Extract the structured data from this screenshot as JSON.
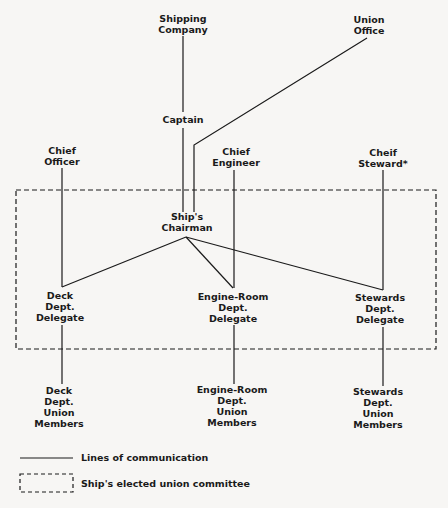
{
  "nodes": {
    "shipping_company": {
      "lines": [
        "Shipping",
        "Company"
      ]
    },
    "union_office": {
      "lines": [
        "Union",
        "Office"
      ]
    },
    "captain": {
      "lines": [
        "Captain"
      ]
    },
    "chief_officer": {
      "lines": [
        "Chief",
        "Officer"
      ]
    },
    "chief_engineer": {
      "lines": [
        "Chief",
        "Engineer"
      ]
    },
    "chief_steward": {
      "lines": [
        "Cheif",
        "Steward*"
      ]
    },
    "ships_chairman": {
      "lines": [
        "Ship's",
        "Chairman"
      ]
    },
    "deck_delegate": {
      "lines": [
        "Deck",
        "Dept.",
        "Delegate"
      ]
    },
    "engine_delegate": {
      "lines": [
        "Engine-Room",
        "Dept.",
        "Delegate"
      ]
    },
    "stewards_delegate": {
      "lines": [
        "Stewards",
        "Dept.",
        "Delegate"
      ]
    },
    "deck_members": {
      "lines": [
        "Deck",
        "Dept.",
        "Union",
        "Members"
      ]
    },
    "engine_members": {
      "lines": [
        "Engine-Room",
        "Dept.",
        "Union",
        "Members"
      ]
    },
    "stewards_members": {
      "lines": [
        "Stewards",
        "Dept.",
        "Union",
        "Members"
      ]
    }
  },
  "legend": {
    "solid_line": "Lines of communication",
    "dashed_box": "Ship's elected union committee"
  },
  "colors": {
    "line": "#1a1a1a",
    "background": "#f7f6f4"
  }
}
